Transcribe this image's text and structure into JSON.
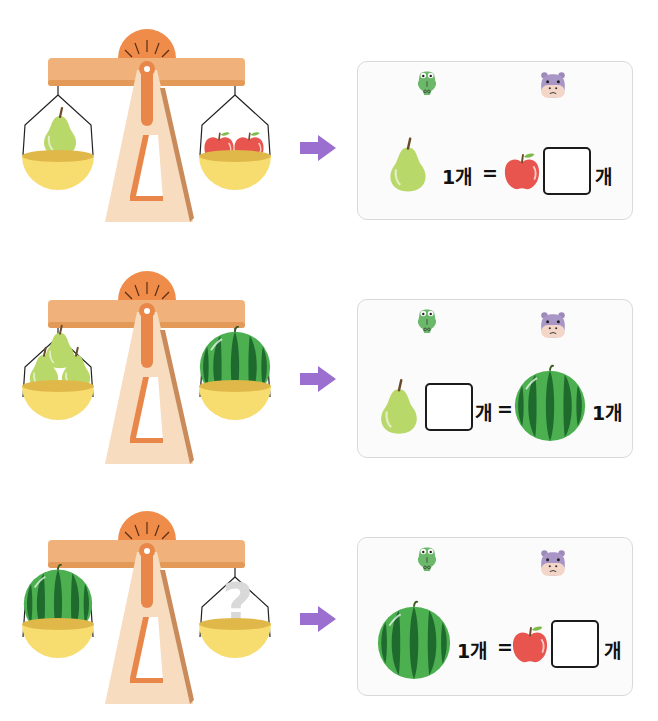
{
  "colors": {
    "beam": "#f0b27a",
    "beam_shadow": "#e39a58",
    "dial": "#f08c4a",
    "stand": "#f8dcc0",
    "stand_shadow": "#c98b5a",
    "pointer": "#e9874a",
    "pan": "#f7dc6f",
    "pan_inner": "#e0b84a",
    "arrow": "#9b6fd0",
    "apple": "#e8544e",
    "pear": "#b9d86a",
    "watermelon_light": "#4caf50",
    "watermelon_dark": "#1f6b2e",
    "question_mark": "#d9d9d9"
  },
  "rows": [
    {
      "scale": {
        "left_pan": "pear x1",
        "right_pan": "apple x2"
      },
      "panel": {
        "animals": [
          "crocodile",
          "hippo"
        ],
        "equation": {
          "left_fruit": "pear",
          "left_count": "1개",
          "equals": "=",
          "right_fruit": "apple",
          "answer_value": "",
          "unit": "개"
        }
      }
    },
    {
      "scale": {
        "left_pan": "pear x3",
        "right_pan": "watermelon x1"
      },
      "panel": {
        "animals": [
          "crocodile",
          "hippo"
        ],
        "equation": {
          "left_fruit": "pear",
          "answer_value": "",
          "unit": "개",
          "equals": "=",
          "right_fruit": "watermelon",
          "right_count": "1개"
        }
      }
    },
    {
      "scale": {
        "left_pan": "watermelon x1",
        "right_pan": "question-mark"
      },
      "panel": {
        "animals": [
          "crocodile",
          "hippo"
        ],
        "equation": {
          "left_fruit": "watermelon",
          "left_count": "1개",
          "equals": "=",
          "right_fruit": "apple",
          "answer_value": "",
          "unit": "개"
        }
      }
    }
  ]
}
